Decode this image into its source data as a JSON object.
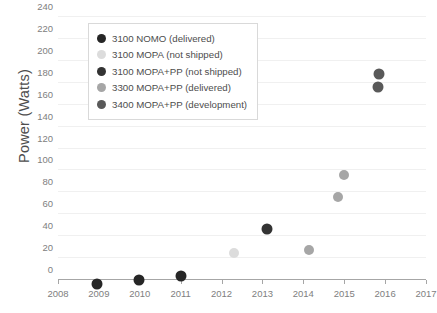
{
  "chart_data": {
    "type": "scatter",
    "title": "",
    "xlabel": "",
    "ylabel": "Power (Watts)",
    "xlim": [
      2008,
      2017
    ],
    "ylim": [
      0,
      240
    ],
    "grid": true,
    "legend_position": "top-left",
    "x_ticks": [
      "2008",
      "2009",
      "2010",
      "2011",
      "2012",
      "2013",
      "2014",
      "2015",
      "2016",
      "2017"
    ],
    "y_ticks": [
      "0",
      "20",
      "40",
      "60",
      "80",
      "100",
      "120",
      "140",
      "160",
      "180",
      "200",
      "220",
      "240"
    ],
    "series": [
      {
        "name": "3100 NOMO (delivered)",
        "color": "#262626",
        "marker_size": 11,
        "points": [
          {
            "x": 2008.95,
            "y": 1
          },
          {
            "x": 2009.98,
            "y": 5
          },
          {
            "x": 2011.0,
            "y": 9
          }
        ]
      },
      {
        "name": "3100 MOPA (not shipped)",
        "color": "#dcdcdc",
        "marker_size": 10,
        "points": [
          {
            "x": 2012.3,
            "y": 29
          }
        ]
      },
      {
        "name": "3100 MOPA+PP (not shipped)",
        "color": "#333333",
        "marker_size": 11,
        "points": [
          {
            "x": 2013.12,
            "y": 52
          }
        ]
      },
      {
        "name": "3300 MOPA+PP (delivered)",
        "color": "#a6a6a6",
        "marker_size": 10,
        "points": [
          {
            "x": 2014.15,
            "y": 32
          },
          {
            "x": 2014.85,
            "y": 80
          },
          {
            "x": 2015.0,
            "y": 100
          }
        ]
      },
      {
        "name": "3400 MOPA+PP (development)",
        "color": "#595959",
        "marker_size": 11,
        "points": [
          {
            "x": 2015.85,
            "y": 193
          },
          {
            "x": 2015.82,
            "y": 181
          }
        ]
      }
    ]
  },
  "legend": {
    "items": [
      {
        "label": "3100 NOMO (delivered)",
        "color": "#262626"
      },
      {
        "label": "3100 MOPA (not shipped)",
        "color": "#dcdcdc"
      },
      {
        "label": "3100 MOPA+PP (not shipped)",
        "color": "#333333"
      },
      {
        "label": "3300 MOPA+PP (delivered)",
        "color": "#a6a6a6"
      },
      {
        "label": "3400 MOPA+PP (development)",
        "color": "#595959"
      }
    ]
  }
}
